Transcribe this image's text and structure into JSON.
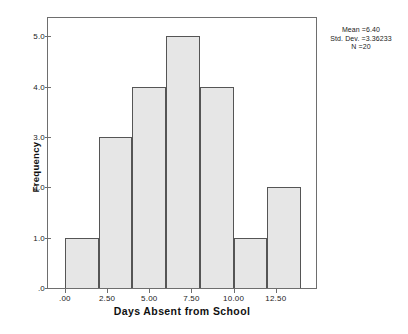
{
  "chart_data": {
    "type": "bar",
    "title": "",
    "xlabel": "Days Absent from School",
    "ylabel": "Frequency",
    "xlim": [
      -1.0,
      15.0
    ],
    "ylim": [
      0,
      5.4
    ],
    "grid": false,
    "legend": "none",
    "bin_width": 2,
    "bin_edges": [
      0,
      2,
      4,
      6,
      8,
      10,
      12,
      14
    ],
    "bin_centers": [
      1,
      3,
      5,
      7,
      9,
      11,
      13
    ],
    "categories": [
      "0-2",
      "2-4",
      "4-6",
      "6-8",
      "8-10",
      "10-12",
      "12-14"
    ],
    "values": [
      1,
      3,
      4,
      5,
      4,
      1,
      2
    ],
    "xticks": [
      0,
      2.5,
      5,
      7.5,
      10,
      12.5
    ],
    "xtick_labels": [
      ".00",
      "2.50",
      "5.00",
      "7.50",
      "10.00",
      "12.50"
    ],
    "yticks": [
      0,
      1,
      2,
      3,
      4,
      5
    ],
    "ytick_labels": [
      ".0",
      "1.0",
      "2.0",
      "3.0",
      "4.0",
      "5.0"
    ],
    "bar_fill_color": "#e6e6e6",
    "bar_border_color": "#555555",
    "axis_color": "#6e6e6e",
    "annotations": {
      "mean_label": "Mean =6.40",
      "std_dev_label": "Std. Dev. =3.36233",
      "n_label": "N =20"
    }
  }
}
